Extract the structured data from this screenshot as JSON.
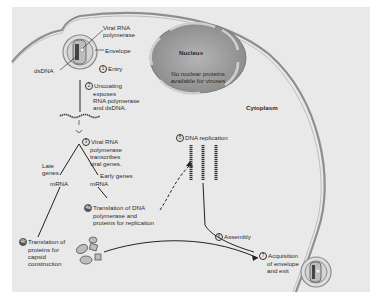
{
  "diagram": {
    "regions": {
      "nucleus": "Nucleus",
      "nucleus_note_line1": "No nuclear proteins",
      "nucleus_note_line2": "available for viruses",
      "cytoplasm": "Cytoplasm"
    },
    "virion_labels": {
      "viral_rna_polymerase_line1": "Viral RNA",
      "viral_rna_polymerase_line2": "polymerase",
      "envelope": "Envelope",
      "dsdna": "dsDNA"
    },
    "steps": [
      {
        "num": "1",
        "lines": [
          "Entry"
        ]
      },
      {
        "num": "2",
        "lines": [
          "Uncoating",
          "exposes",
          "RNA polymerase",
          "and dsDNA."
        ]
      },
      {
        "num": "3",
        "lines": [
          "Viral RNA",
          "polymerase",
          "transcribes",
          "viral genes."
        ]
      },
      {
        "num": "4a",
        "lines": [
          "Translation of DNA",
          "polymerase and",
          "proteins for replication"
        ]
      },
      {
        "num": "4b",
        "lines": [
          "Translation of",
          "proteins for",
          "capsid",
          "construction"
        ]
      },
      {
        "num": "5",
        "lines": [
          "DNA replication"
        ]
      },
      {
        "num": "6",
        "lines": [
          "Assembly"
        ]
      },
      {
        "num": "7",
        "lines": [
          "Acquisition",
          "of envelope",
          "and exit"
        ]
      }
    ],
    "branches": {
      "late_genes_line1": "Late",
      "late_genes_line2": "genes",
      "early_genes": "Early genes",
      "mrna_left": "mRNA",
      "mrna_right": "mRNA"
    },
    "colors": {
      "background": "#e9e9e9",
      "membrane": "#9a9a9a",
      "nucleus_fill": "#9c9c9c",
      "text": "#2a2a2a"
    }
  }
}
